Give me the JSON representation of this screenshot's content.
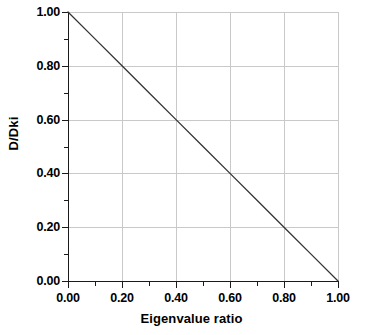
{
  "chart_data": {
    "type": "line",
    "title": "",
    "xlabel": "Eigenvalue ratio",
    "ylabel": "D/Dki",
    "xlim": [
      0.0,
      1.0
    ],
    "ylim": [
      0.0,
      1.0
    ],
    "grid": true,
    "legend": false,
    "legend_position": "none",
    "x_ticks": [
      0.0,
      0.2,
      0.4,
      0.6,
      0.8,
      1.0
    ],
    "y_ticks": [
      0.0,
      0.2,
      0.4,
      0.6,
      0.8,
      1.0
    ],
    "x_tick_labels": [
      "0.00",
      "0.20",
      "0.40",
      "0.60",
      "0.80",
      "1.00"
    ],
    "y_tick_labels": [
      "0.00",
      "0.20",
      "0.40",
      "0.60",
      "0.80",
      "1.00"
    ],
    "x_minor_ticks": [
      0.1,
      0.3,
      0.5,
      0.7,
      0.9
    ],
    "y_minor_ticks": [
      0.1,
      0.3,
      0.5,
      0.7,
      0.9
    ],
    "series": [
      {
        "name": "D/Dki",
        "x": [
          0.0,
          0.1,
          0.2,
          0.3,
          0.4,
          0.5,
          0.6,
          0.7,
          0.8,
          0.9,
          1.0
        ],
        "values": [
          1.0,
          0.9,
          0.8,
          0.7,
          0.6,
          0.5,
          0.4,
          0.3,
          0.2,
          0.1,
          0.0
        ],
        "color": "#333333"
      }
    ],
    "annotations": []
  },
  "style": {
    "background": "#ffffff",
    "grid_color": "#c9c9c9",
    "axis_color": "#1a1a1a",
    "text_color": "#000000",
    "line_color": "#333333"
  }
}
